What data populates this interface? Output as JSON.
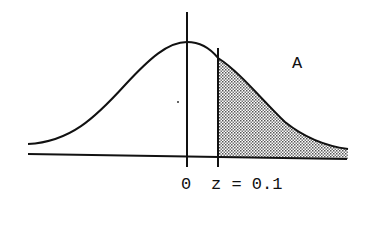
{
  "diagram": {
    "type": "normal-distribution-shaded-tail",
    "region_label": "A",
    "axis_labels": {
      "mean": "0",
      "z": "z = 0.1"
    },
    "shaded_region": "right tail beyond z",
    "colors": {
      "line": "#111111",
      "shade_dot": "#444444",
      "background": "#ffffff"
    }
  }
}
